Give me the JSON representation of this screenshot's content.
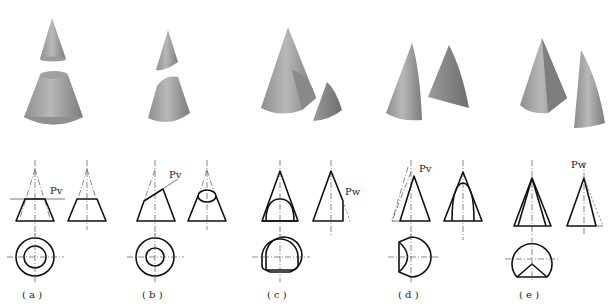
{
  "figure": {
    "panels": [
      {
        "id": "a",
        "caption": "( a )",
        "plane_label": "Pv",
        "description": "Cutting plane perpendicular to axis - section is a circle (frustum + small cone)"
      },
      {
        "id": "b",
        "caption": "( b )",
        "plane_label": "Pv",
        "description": "Cutting plane inclined to axis - section is an ellipse"
      },
      {
        "id": "c",
        "caption": "( c )",
        "plane_label": "Pw",
        "description": "Cutting plane parallel to axis - section is a hyperbola"
      },
      {
        "id": "d",
        "caption": "( d )",
        "plane_label": "Pv",
        "description": "Cutting plane parallel to a generatrix - section is a parabola"
      },
      {
        "id": "e",
        "caption": "( e )",
        "plane_label": "Pw",
        "description": "Cutting plane through apex - section is a triangle"
      }
    ]
  },
  "colors": {
    "background": "#ffffff",
    "line": "#111111",
    "solid_light": "#b4b4b4",
    "solid_dark": "#7a7a7a"
  }
}
